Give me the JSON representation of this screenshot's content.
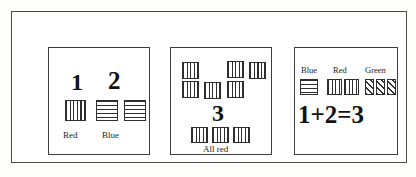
{
  "figure": {
    "panels": [
      {
        "id": "panel-1",
        "name": "count-by-color-panel",
        "numerals": [
          {
            "text": "1",
            "for_group": "Red"
          },
          {
            "text": "2",
            "for_group": "Blue"
          }
        ],
        "groups": [
          {
            "label": "Red",
            "pattern": "vertical-stripes",
            "count": 1
          },
          {
            "label": "Blue",
            "pattern": "horizontal-stripes",
            "count": 2
          }
        ],
        "captions": [
          "Red",
          "Blue"
        ]
      },
      {
        "id": "panel-2",
        "name": "all-red-total-panel",
        "numerals": [
          {
            "text": "3",
            "for_group": "All red"
          }
        ],
        "scattered": {
          "pattern": "vertical-stripes",
          "count": 6,
          "description": "scattered red squares above the numeral"
        },
        "bottom_row": {
          "pattern": "vertical-stripes",
          "count": 3
        },
        "captions": [
          "All red"
        ]
      },
      {
        "id": "panel-3",
        "name": "addition-equation-panel",
        "swatch_labels": [
          "Blue",
          "Red",
          "Green"
        ],
        "swatches": [
          {
            "label": "Blue",
            "pattern": "horizontal-stripes",
            "count": 1
          },
          {
            "label": "Red",
            "pattern": "vertical-stripes",
            "count": 2
          },
          {
            "label": "Green",
            "pattern": "diagonal-stripes",
            "count": 3
          }
        ],
        "equation": "1+2=3"
      }
    ]
  },
  "colors": {
    "ink": "#2e2e2e",
    "frame": "#4a4a4a",
    "paper": "#ffffff"
  }
}
